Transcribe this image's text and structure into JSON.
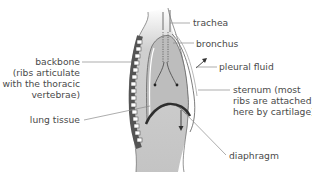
{
  "diagram": {
    "labels": {
      "trachea": "trachea",
      "bronchus": "bronchus",
      "pleural_fluid": "pleural fluid",
      "backbone": "backbone",
      "backbone_note_1": "(ribs articulate",
      "backbone_note_2": "with the thoracic",
      "backbone_note_3": "vertebrae)",
      "sternum_1": "sternum (most",
      "sternum_2": "ribs are attached",
      "sternum_3": "here by cartilage)",
      "lung_tissue": "lung tissue",
      "diaphragm": "diaphragm"
    },
    "colors": {
      "text": "#4a4a4a",
      "leader_line": "#8a8a8a",
      "body_fill": "#c8c8c8",
      "lung_fill": "#bdbdbd",
      "outline": "#6e6e6e",
      "diaphragm": "#2e2e2e"
    }
  }
}
